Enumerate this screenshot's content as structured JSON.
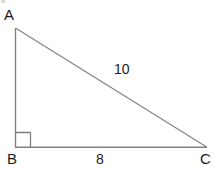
{
  "figure": {
    "type": "right-triangle-diagram",
    "background_color": "#ffffff",
    "stroke_color": "#808080",
    "text_color": "#1b1b1b",
    "canvas": {
      "width": 214,
      "height": 171
    },
    "vertices": {
      "A": {
        "label": "A",
        "x": 15,
        "y": 28
      },
      "B": {
        "label": "B",
        "x": 15,
        "y": 147
      },
      "C": {
        "label": "C",
        "x": 207,
        "y": 147
      }
    },
    "sides": {
      "leg_vertical": {
        "from": "A",
        "to": "B",
        "label": ""
      },
      "leg_base": {
        "from": "B",
        "to": "C",
        "label": "8"
      },
      "hypotenuse": {
        "from": "A",
        "to": "C",
        "label": "10"
      }
    },
    "right_angle": {
      "at_vertex": "B",
      "marker": "square",
      "x": 15,
      "y": 132,
      "size": 15
    },
    "labels": {
      "vertex_a": "A",
      "vertex_b": "B",
      "vertex_c": "C",
      "hypotenuse_length": "10",
      "base_length": "8"
    }
  }
}
